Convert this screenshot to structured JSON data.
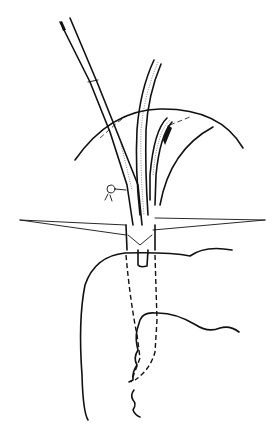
{
  "figure": {
    "type": "medical-line-illustration",
    "colors": {
      "ink": "#111111",
      "background": "#ffffff"
    },
    "labels": []
  }
}
